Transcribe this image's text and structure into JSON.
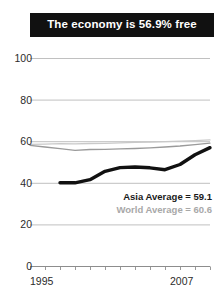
{
  "title": {
    "text": "The economy is 56.9% free"
  },
  "legend": {
    "asia": "Asia Average = 59.1",
    "world": "World Average = 60.6"
  },
  "axis": {
    "y_ticks": [
      "100",
      "80",
      "60",
      "40",
      "20",
      "0"
    ],
    "x_start": "1995",
    "x_end": "2007"
  },
  "colors": {
    "title_bar": "#111111",
    "title_text": "#ffffff",
    "country_line": "#111111",
    "asia_line": "#9a9a9a",
    "world_line": "#c9c9c9",
    "gridline": "#b9b9b9",
    "axis_text": "#2b2b2b"
  },
  "chart_data": {
    "type": "line",
    "title": "The economy is 56.9% free",
    "xlabel": "",
    "ylabel": "",
    "xlim": [
      1995,
      2007
    ],
    "ylim": [
      0,
      100
    ],
    "grid": true,
    "legend_position": "inside-right",
    "x": [
      1995,
      1996,
      1997,
      1998,
      1999,
      2000,
      2001,
      2002,
      2003,
      2004,
      2005,
      2006,
      2007
    ],
    "series": [
      {
        "name": "Country",
        "label": "",
        "color": "#111111",
        "width": "thick",
        "values": [
          null,
          null,
          40.0,
          40.0,
          41.5,
          45.5,
          47.3,
          47.6,
          47.2,
          46.3,
          48.8,
          53.5,
          56.9
        ]
      },
      {
        "name": "Asia Average",
        "label": "Asia Average = 59.1",
        "color": "#9a9a9a",
        "width": "thin",
        "values": [
          58.0,
          57.2,
          56.4,
          55.6,
          56.0,
          56.1,
          56.3,
          56.5,
          56.8,
          57.2,
          57.7,
          58.4,
          59.1
        ]
      },
      {
        "name": "World Average",
        "label": "World Average = 60.6",
        "color": "#c9c9c9",
        "width": "thin",
        "values": [
          58.5,
          58.6,
          58.8,
          58.7,
          58.9,
          59.0,
          59.2,
          59.4,
          59.6,
          59.8,
          60.0,
          60.3,
          60.6
        ]
      }
    ],
    "annotations": [
      {
        "text": "Asia Average = 59.1",
        "style": "bold-dark"
      },
      {
        "text": "World Average = 60.6",
        "style": "bold-light"
      }
    ]
  }
}
